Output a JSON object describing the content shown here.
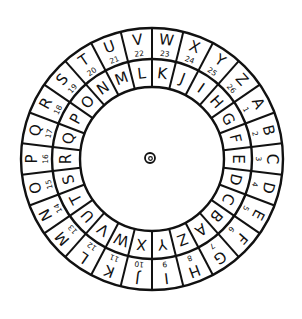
{
  "diagram": {
    "type": "cipher-wheel",
    "center_mark": "ⓞ",
    "outer_ring": {
      "start_angle_deg": -6.92,
      "direction": "clockwise",
      "letters": [
        "V",
        "W",
        "X",
        "Y",
        "Z",
        "A",
        "B",
        "C",
        "D",
        "E",
        "F",
        "G",
        "H",
        "I",
        "J",
        "K",
        "L",
        "M",
        "N",
        "O",
        "P",
        "Q",
        "R",
        "S",
        "T",
        "U"
      ],
      "numbers": [
        "22",
        "23",
        "24",
        "25",
        "26",
        "1",
        "2",
        "3",
        "4",
        "5",
        "6",
        "7",
        "8",
        "9",
        "10",
        "11",
        "12",
        "13",
        "14",
        "15",
        "16",
        "17",
        "18",
        "19",
        "20",
        "21"
      ]
    },
    "inner_ring": {
      "start_angle_deg": 173.08,
      "direction": "clockwise",
      "letters": [
        "Y",
        "X",
        "W",
        "V",
        "U",
        "T",
        "S",
        "R",
        "Q",
        "P",
        "O",
        "N",
        "M",
        "L",
        "K",
        "J",
        "I",
        "H",
        "G",
        "F",
        "E",
        "D",
        "C",
        "B",
        "A",
        "Z"
      ]
    },
    "colors": {
      "ink": "#111111",
      "paper": "#ffffff"
    }
  }
}
